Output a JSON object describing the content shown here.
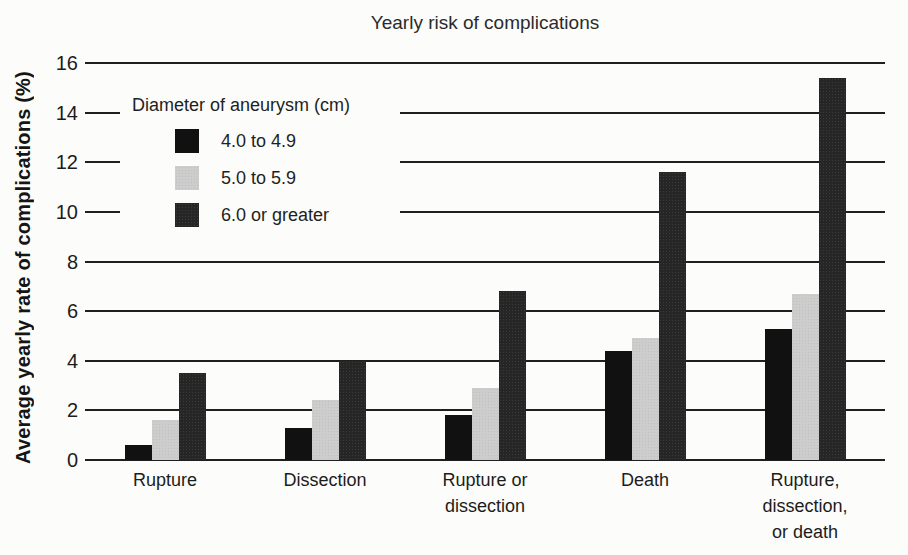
{
  "figure": {
    "background": "#fcfcfa",
    "axis_color": "#1f1f1f",
    "text_color": "#1c1c1c"
  },
  "chart_data": {
    "type": "bar",
    "title": "Yearly risk of complications",
    "ylabel": "Average yearly rate of complications (%)",
    "xlabel": "",
    "ylim": [
      0,
      16
    ],
    "ytick_step": 2,
    "yticks": [
      0,
      2,
      4,
      6,
      8,
      10,
      12,
      14,
      16
    ],
    "grid": "horizontal",
    "legend_title": "Diameter of aneurysm (cm)",
    "legend_position": "upper-left-inside",
    "categories": [
      "Rupture",
      "Dissection",
      "Rupture or dissection",
      "Death",
      "Rupture, dissection, or death"
    ],
    "categories_wrapped": [
      "Rupture",
      "Dissection",
      "Rupture or\ndissection",
      "Death",
      "Rupture,\ndissection,\nor death"
    ],
    "series": [
      {
        "name": "4.0 to 4.9",
        "color": "#111111",
        "values": [
          0.6,
          1.3,
          1.8,
          4.4,
          5.3
        ]
      },
      {
        "name": "5.0 to 5.9",
        "color": "#cdcdcd",
        "values": [
          1.6,
          2.4,
          2.9,
          4.9,
          6.7
        ]
      },
      {
        "name": "6.0 or greater",
        "color": "#262626",
        "values": [
          3.5,
          4.0,
          6.8,
          11.6,
          15.4
        ]
      }
    ]
  }
}
